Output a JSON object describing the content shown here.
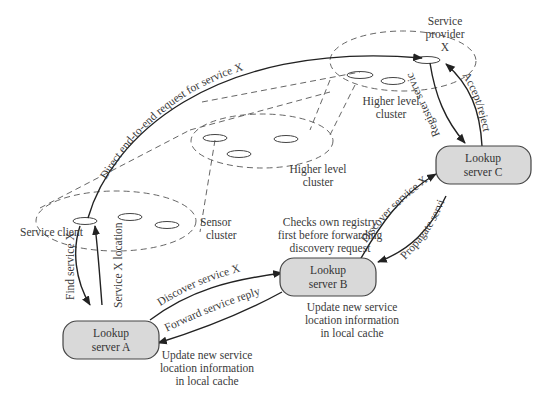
{
  "diagram": {
    "type": "service-discovery-network",
    "colors": {
      "background": "#ffffff",
      "server_fill": "#d9d9d9",
      "stroke": "#333333",
      "text": "#3a3a3a"
    },
    "servers": {
      "a": {
        "line1": "Lookup",
        "line2": "server A"
      },
      "b": {
        "line1": "Lookup",
        "line2": "server B"
      },
      "c": {
        "line1": "Lookup",
        "line2": "server C"
      }
    },
    "clusters": {
      "sensor": {
        "line1": "Sensor",
        "line2": "cluster"
      },
      "higher_mid": {
        "line1": "Higher level",
        "line2": "cluster"
      },
      "higher_top": {
        "line1": "Higher level",
        "line2": "cluster"
      }
    },
    "nodes": {
      "client": "Service client",
      "provider": {
        "line1": "Service",
        "line2": "provider",
        "line3": "X"
      }
    },
    "edges": {
      "direct": "Direct end-to-end request for service X",
      "find": "Find service X",
      "location": "Service X location",
      "discover_ab": "Discover service X",
      "forward_reply": "Forward service reply",
      "discover_bc": "Discover service X",
      "propagate": "Propagate service info",
      "register": "Register service X",
      "accept": "Accept/reject"
    },
    "notes": {
      "checks": {
        "line1": "Checks own registry",
        "line2": "first before forwarding",
        "line3": "discovery request"
      },
      "update_b": {
        "line1": "Update new service",
        "line2": "location information",
        "line3": "in local cache"
      },
      "update_a": {
        "line1": "Update new service",
        "line2": "location information",
        "line3": "in local cache"
      }
    }
  }
}
